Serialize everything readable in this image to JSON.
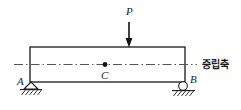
{
  "figure": {
    "type": "simply-supported-beam-diagram",
    "labels": {
      "load": "P",
      "centroid": "C",
      "left_support": "A",
      "right_support": "B",
      "neutral_axis": "중립축"
    },
    "colors": {
      "background": "#ffffff",
      "stroke": "#1a1a1a",
      "centerline": "#555555"
    },
    "geometry": {
      "beam": {
        "x": 30,
        "y": 47,
        "width": 155,
        "height": 35
      },
      "load_arrow": {
        "x": 129,
        "y_top": 22,
        "y_tip": 47
      },
      "centroid_dot": {
        "cx": 105,
        "cy": 64.5,
        "r": 2.4
      },
      "neutral_axis_line": {
        "x1": 14,
        "x2": 197,
        "y": 64.5
      },
      "pin_support": {
        "apex_x": 31,
        "apex_y": 82,
        "base_y": 89,
        "half_width": 7
      },
      "roller_support": {
        "cx": 183,
        "cy": 86,
        "r": 4.3,
        "ground_y": 90.5
      }
    }
  }
}
